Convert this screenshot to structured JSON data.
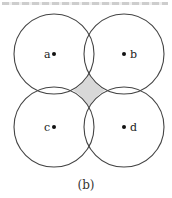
{
  "figure": {
    "caption": "(b)",
    "stroke_color": "#444444",
    "overlap_fill": "#d8d8d8",
    "radius": 40,
    "nodes": [
      {
        "id": "a",
        "label": "a",
        "cx": 54,
        "cy": 54,
        "label_side": "left"
      },
      {
        "id": "b",
        "label": "b",
        "cx": 124,
        "cy": 54,
        "label_side": "right"
      },
      {
        "id": "c",
        "label": "c",
        "cx": 54,
        "cy": 127,
        "label_side": "left"
      },
      {
        "id": "d",
        "label": "d",
        "cx": 124,
        "cy": 127,
        "label_side": "right"
      }
    ],
    "shaded_region": "central area outside all four circles between them"
  }
}
